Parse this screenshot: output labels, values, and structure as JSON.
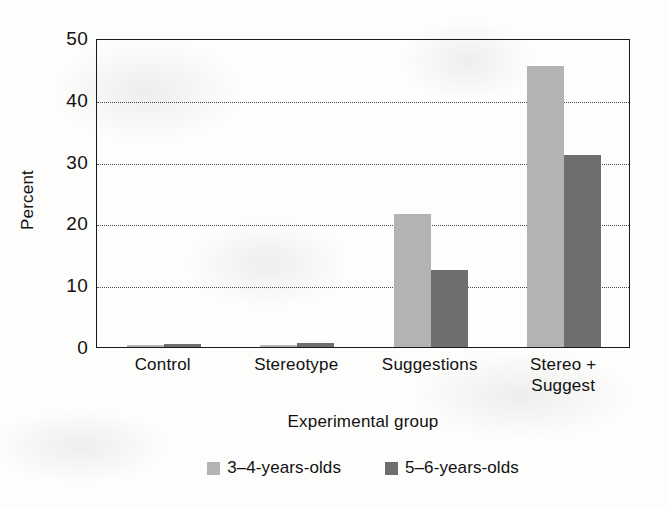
{
  "chart_data": {
    "type": "bar",
    "title": "",
    "subtitle": "",
    "xlabel": "Experimental group",
    "ylabel": "Percent",
    "categories": [
      "Control",
      "Stereotype",
      "Suggestions",
      "Stereo +\nSuggest"
    ],
    "category_lines": [
      [
        "Control"
      ],
      [
        "Stereotype"
      ],
      [
        "Suggestions"
      ],
      [
        "Stereo +",
        "Suggest"
      ]
    ],
    "series": [
      {
        "name": "3–4-years-olds",
        "color": "#b3b3b3",
        "values": [
          0.3,
          0.4,
          21.5,
          45.5
        ]
      },
      {
        "name": "5–6-years-olds",
        "color": "#6e6e6e",
        "values": [
          0.5,
          0.6,
          12.5,
          31.0
        ]
      }
    ],
    "ylim": [
      0,
      50
    ],
    "yticks": [
      0,
      10,
      20,
      30,
      40,
      50
    ],
    "ytick_labels": [
      "0",
      "10",
      "20",
      "30",
      "40",
      "50"
    ],
    "gridlines": [
      10,
      20,
      30,
      40
    ],
    "grid": true,
    "grid_style": "dotted",
    "legend_position": "bottom-center",
    "frame": true,
    "background": "#fdfdfb",
    "axis_color": "#1a1a1a"
  },
  "axes": {
    "y_title": "Percent",
    "x_title": "Experimental group"
  },
  "legend": {
    "items": [
      {
        "label": "3–4-years-olds",
        "color": "#b3b3b3"
      },
      {
        "label": "5–6-years-olds",
        "color": "#6e6e6e"
      }
    ]
  }
}
